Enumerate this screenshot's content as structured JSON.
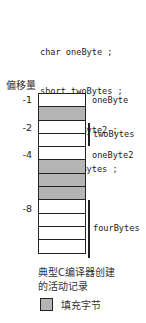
{
  "code": {
    "lines": [
      "char oneByte ;",
      "short twoBytes ;",
      "char oneByte2 ;",
      "int fourBytes ;"
    ]
  },
  "axis_title": "偏移量",
  "offsets": [
    "-1",
    "-2",
    "-4",
    "-8"
  ],
  "rows": [
    "data",
    "pad",
    "data",
    "data",
    "data",
    "pad",
    "pad",
    "pad",
    "data",
    "data",
    "data",
    "data"
  ],
  "labels": {
    "oneByte": "oneByte",
    "twoBytes": "twoBytes",
    "oneByte2": "oneByte2",
    "fourBytes": "fourBytes"
  },
  "caption": [
    "典型C编译器创建",
    "的活动记录"
  ],
  "legend": {
    "label": "填充字节",
    "color": "#b4b4b4"
  }
}
